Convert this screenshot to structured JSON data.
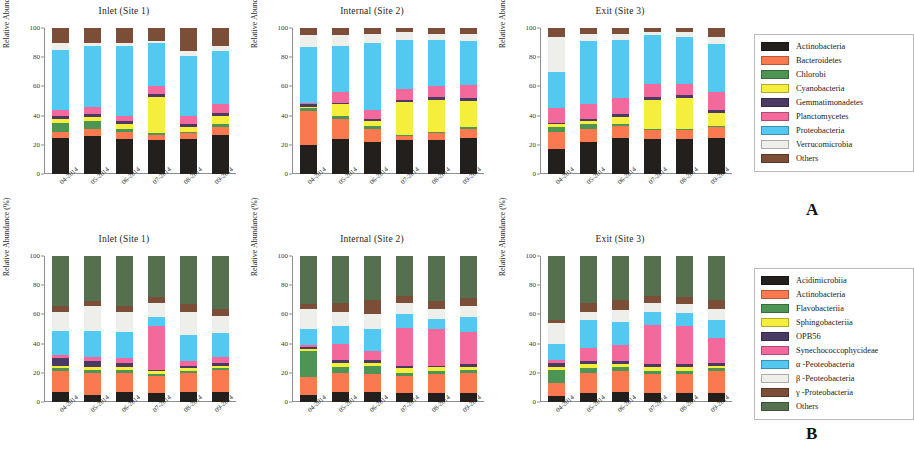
{
  "figure": {
    "panel_letters": [
      "A",
      "B"
    ],
    "y_axis_label": "Relative Abundance (%)",
    "y_ticks": [
      "0",
      "20",
      "40",
      "60",
      "80",
      "100"
    ],
    "x_ticks": [
      "04-2014",
      "05-2014",
      "06-2014",
      "07-2014",
      "08-2014",
      "09-2014"
    ],
    "panel_titles": [
      "Inlet (Site 1)",
      "Internal (Site 2)",
      "Exit (Site 3)"
    ]
  },
  "legend_a": {
    "items": [
      {
        "label": "Actinobacteria",
        "color": "#231f1c"
      },
      {
        "label": "Bacteroidetes",
        "color": "#f97a50"
      },
      {
        "label": "Chlorobi",
        "color": "#4e9455"
      },
      {
        "label": "Cyanobacteria",
        "color": "#f6ee3c"
      },
      {
        "label": "Gemmatimonadetes",
        "color": "#4b3a63"
      },
      {
        "label": "Planctomycetes",
        "color": "#f4699c"
      },
      {
        "label": "Proteobacteria",
        "color": "#53c8f0"
      },
      {
        "label": "Verrucomicrobia",
        "color": "#eeeeea"
      },
      {
        "label": "Others",
        "color": "#7c4e38"
      }
    ]
  },
  "legend_b": {
    "items": [
      {
        "label": "Acidimicrobiia",
        "color": "#231f1c"
      },
      {
        "label": "Actinobacteria",
        "color": "#f97a50"
      },
      {
        "label": "Flavobacteriia",
        "color": "#4e9455"
      },
      {
        "label": "Sphingobacteriia",
        "color": "#f6ee3c"
      },
      {
        "label": "OPB56",
        "color": "#4b3a63"
      },
      {
        "label": "Synechococcophycideae",
        "color": "#f4699c"
      },
      {
        "label": "α -Peoteobacteria",
        "color": "#53c8f0"
      },
      {
        "label": "β -Peoteobacteria",
        "color": "#eeeeea"
      },
      {
        "label": "γ -Proteobacteria",
        "color": "#7c4e38"
      },
      {
        "label": "Others",
        "color": "#55704e"
      }
    ]
  },
  "chart_data": [
    {
      "type": "bar",
      "stacked": true,
      "panel": "A",
      "title": "Inlet (Site 1)",
      "xlabel": "",
      "ylabel": "Relative Abundance (%)",
      "ylim": [
        0,
        100
      ],
      "grid": false,
      "legend_position": "right",
      "categories": [
        "04-2014",
        "05-2014",
        "06-2014",
        "07-2014",
        "08-2014",
        "09-2014"
      ],
      "series": [
        {
          "name": "Actinobacteria",
          "color": "#231f1c",
          "values": [
            25,
            26,
            24,
            23,
            24,
            27
          ]
        },
        {
          "name": "Bacteroidetes",
          "color": "#f97a50",
          "values": [
            4,
            5,
            5,
            4,
            4,
            5
          ]
        },
        {
          "name": "Chlorobi",
          "color": "#4e9455",
          "values": [
            6,
            5,
            2,
            1,
            1,
            2
          ]
        },
        {
          "name": "Cyanobacteria",
          "color": "#f6ee3c",
          "values": [
            3,
            3,
            3,
            25,
            3,
            6
          ]
        },
        {
          "name": "Gemmatimonadetes",
          "color": "#4b3a63",
          "values": [
            2,
            2,
            2,
            2,
            2,
            2
          ]
        },
        {
          "name": "Planctomycetes",
          "color": "#f4699c",
          "values": [
            4,
            5,
            4,
            5,
            6,
            6
          ]
        },
        {
          "name": "Proteobacteria",
          "color": "#53c8f0",
          "values": [
            41,
            42,
            48,
            30,
            41,
            36
          ]
        },
        {
          "name": "Verrucomicrobia",
          "color": "#eeeeea",
          "values": [
            5,
            2,
            2,
            1,
            3,
            4
          ]
        },
        {
          "name": "Others",
          "color": "#7c4e38",
          "values": [
            10,
            10,
            10,
            9,
            16,
            12
          ]
        }
      ]
    },
    {
      "type": "bar",
      "stacked": true,
      "panel": "A",
      "title": "Internal (Site 2)",
      "xlabel": "",
      "ylabel": "Relative Abundance (%)",
      "ylim": [
        0,
        100
      ],
      "grid": false,
      "legend_position": "right",
      "categories": [
        "04-2014",
        "05-2014",
        "06-2014",
        "07-2014",
        "08-2014",
        "09-2014"
      ],
      "series": [
        {
          "name": "Actinobacteria",
          "color": "#231f1c",
          "values": [
            20,
            24,
            22,
            23,
            23,
            25
          ]
        },
        {
          "name": "Bacteroidetes",
          "color": "#f97a50",
          "values": [
            23,
            14,
            9,
            3,
            5,
            6
          ]
        },
        {
          "name": "Chlorobi",
          "color": "#4e9455",
          "values": [
            2,
            2,
            2,
            1,
            1,
            1
          ]
        },
        {
          "name": "Cyanobacteria",
          "color": "#f6ee3c",
          "values": [
            1,
            8,
            3,
            22,
            22,
            18
          ]
        },
        {
          "name": "Gemmatimonadetes",
          "color": "#4b3a63",
          "values": [
            2,
            1,
            2,
            2,
            2,
            2
          ]
        },
        {
          "name": "Planctomycetes",
          "color": "#f4699c",
          "values": [
            1,
            7,
            6,
            7,
            7,
            9
          ]
        },
        {
          "name": "Proteobacteria",
          "color": "#53c8f0",
          "values": [
            38,
            32,
            46,
            34,
            32,
            30
          ]
        },
        {
          "name": "Verrucomicrobia",
          "color": "#eeeeea",
          "values": [
            8,
            7,
            6,
            5,
            4,
            5
          ]
        },
        {
          "name": "Others",
          "color": "#7c4e38",
          "values": [
            5,
            5,
            4,
            3,
            4,
            4
          ]
        }
      ]
    },
    {
      "type": "bar",
      "stacked": true,
      "panel": "A",
      "title": "Exit (Site 3)",
      "xlabel": "",
      "ylabel": "Relative Abundance (%)",
      "ylim": [
        0,
        100
      ],
      "grid": false,
      "legend_position": "right",
      "categories": [
        "04-2014",
        "05-2014",
        "06-2014",
        "07-2014",
        "08-2014",
        "09-2014"
      ],
      "series": [
        {
          "name": "Actinobacteria",
          "color": "#231f1c",
          "values": [
            17,
            22,
            25,
            24,
            24,
            25
          ]
        },
        {
          "name": "Bacteroidetes",
          "color": "#f97a50",
          "values": [
            12,
            9,
            8,
            6,
            6,
            7
          ]
        },
        {
          "name": "Chlorobi",
          "color": "#4e9455",
          "values": [
            3,
            3,
            1,
            1,
            1,
            1
          ]
        },
        {
          "name": "Cyanobacteria",
          "color": "#f6ee3c",
          "values": [
            2,
            2,
            5,
            20,
            21,
            9
          ]
        },
        {
          "name": "Gemmatimonadetes",
          "color": "#4b3a63",
          "values": [
            1,
            2,
            2,
            2,
            2,
            2
          ]
        },
        {
          "name": "Planctomycetes",
          "color": "#f4699c",
          "values": [
            10,
            10,
            11,
            9,
            8,
            12
          ]
        },
        {
          "name": "Proteobacteria",
          "color": "#53c8f0",
          "values": [
            25,
            43,
            40,
            33,
            32,
            33
          ]
        },
        {
          "name": "Verrucomicrobia",
          "color": "#eeeeea",
          "values": [
            24,
            5,
            4,
            2,
            3,
            5
          ]
        },
        {
          "name": "Others",
          "color": "#7c4e38",
          "values": [
            6,
            4,
            4,
            3,
            3,
            6
          ]
        }
      ]
    },
    {
      "type": "bar",
      "stacked": true,
      "panel": "B",
      "title": "Inlet (Site 1)",
      "xlabel": "",
      "ylabel": "Relative Abundance (%)",
      "ylim": [
        0,
        100
      ],
      "grid": false,
      "legend_position": "right",
      "categories": [
        "04-2014",
        "05-2014",
        "06-2014",
        "07-2014",
        "08-2014",
        "09-2014"
      ],
      "series": [
        {
          "name": "Acidimicrobiia",
          "color": "#231f1c",
          "values": [
            7,
            5,
            7,
            6,
            7,
            7
          ]
        },
        {
          "name": "Actinobacteria",
          "color": "#f97a50",
          "values": [
            14,
            15,
            13,
            12,
            13,
            15
          ]
        },
        {
          "name": "Flavobacteriia",
          "color": "#4e9455",
          "values": [
            2,
            2,
            2,
            1,
            1,
            1
          ]
        },
        {
          "name": "Sphingobacteriia",
          "color": "#f6ee3c",
          "values": [
            2,
            2,
            2,
            2,
            2,
            2
          ]
        },
        {
          "name": "OPB56",
          "color": "#4b3a63",
          "values": [
            5,
            4,
            3,
            1,
            2,
            2
          ]
        },
        {
          "name": "Synechococcophycideae",
          "color": "#f4699c",
          "values": [
            2,
            3,
            3,
            30,
            3,
            4
          ]
        },
        {
          "name": "α -Peoteobacteria",
          "color": "#53c8f0",
          "values": [
            17,
            18,
            18,
            6,
            18,
            16
          ]
        },
        {
          "name": "β -Peoteobacteria",
          "color": "#eeeeea",
          "values": [
            13,
            17,
            14,
            10,
            16,
            12
          ]
        },
        {
          "name": "γ -Proteobacteria",
          "color": "#7c4e38",
          "values": [
            4,
            3,
            4,
            4,
            5,
            5
          ]
        },
        {
          "name": "Others",
          "color": "#55704e",
          "values": [
            34,
            31,
            34,
            28,
            33,
            36
          ]
        }
      ]
    },
    {
      "type": "bar",
      "stacked": true,
      "panel": "B",
      "title": "Internal (Site 2)",
      "xlabel": "",
      "ylabel": "Relative Abundance (%)",
      "ylim": [
        0,
        100
      ],
      "grid": false,
      "legend_position": "right",
      "categories": [
        "04-2014",
        "05-2014",
        "06-2014",
        "07-2014",
        "08-2014",
        "09-2014"
      ],
      "series": [
        {
          "name": "Acidimicrobiia",
          "color": "#231f1c",
          "values": [
            5,
            7,
            7,
            6,
            6,
            6
          ]
        },
        {
          "name": "Actinobacteria",
          "color": "#f97a50",
          "values": [
            12,
            13,
            12,
            12,
            13,
            14
          ]
        },
        {
          "name": "Flavobacteriia",
          "color": "#4e9455",
          "values": [
            18,
            4,
            6,
            2,
            2,
            2
          ]
        },
        {
          "name": "Sphingobacteriia",
          "color": "#f6ee3c",
          "values": [
            1,
            3,
            2,
            3,
            3,
            2
          ]
        },
        {
          "name": "OPB56",
          "color": "#4b3a63",
          "values": [
            2,
            2,
            2,
            2,
            1,
            2
          ]
        },
        {
          "name": "Synechococcophycideae",
          "color": "#f4699c",
          "values": [
            1,
            11,
            6,
            26,
            25,
            22
          ]
        },
        {
          "name": "α -Peoteobacteria",
          "color": "#53c8f0",
          "values": [
            11,
            12,
            15,
            9,
            7,
            10
          ]
        },
        {
          "name": "β -Peoteobacteria",
          "color": "#eeeeea",
          "values": [
            14,
            10,
            10,
            8,
            7,
            8
          ]
        },
        {
          "name": "γ -Proteobacteria",
          "color": "#7c4e38",
          "values": [
            3,
            6,
            10,
            5,
            5,
            5
          ]
        },
        {
          "name": "Others",
          "color": "#55704e",
          "values": [
            33,
            32,
            30,
            27,
            31,
            29
          ]
        }
      ]
    },
    {
      "type": "bar",
      "stacked": true,
      "panel": "B",
      "title": "Exit (Site 3)",
      "xlabel": "",
      "ylabel": "Relative Abundance (%)",
      "ylim": [
        0,
        100
      ],
      "grid": false,
      "legend_position": "right",
      "categories": [
        "04-2014",
        "05-2014",
        "06-2014",
        "07-2014",
        "08-2014",
        "09-2014"
      ],
      "series": [
        {
          "name": "Acidimicrobiia",
          "color": "#231f1c",
          "values": [
            4,
            6,
            7,
            6,
            6,
            6
          ]
        },
        {
          "name": "Actinobacteria",
          "color": "#f97a50",
          "values": [
            9,
            14,
            14,
            13,
            13,
            15
          ]
        },
        {
          "name": "Flavobacteriia",
          "color": "#4e9455",
          "values": [
            9,
            3,
            3,
            2,
            2,
            2
          ]
        },
        {
          "name": "Sphingobacteriia",
          "color": "#f6ee3c",
          "values": [
            2,
            3,
            2,
            3,
            3,
            2
          ]
        },
        {
          "name": "OPB56",
          "color": "#4b3a63",
          "values": [
            3,
            2,
            2,
            2,
            2,
            2
          ]
        },
        {
          "name": "Synechococcophycideae",
          "color": "#f4699c",
          "values": [
            2,
            9,
            11,
            27,
            26,
            17
          ]
        },
        {
          "name": "α -Peoteobacteria",
          "color": "#53c8f0",
          "values": [
            11,
            19,
            16,
            9,
            9,
            12
          ]
        },
        {
          "name": "β -Peoteobacteria",
          "color": "#eeeeea",
          "values": [
            14,
            6,
            8,
            6,
            6,
            8
          ]
        },
        {
          "name": "γ -Proteobacteria",
          "color": "#7c4e38",
          "values": [
            2,
            6,
            7,
            5,
            5,
            6
          ]
        },
        {
          "name": "Others",
          "color": "#55704e",
          "values": [
            44,
            32,
            30,
            27,
            28,
            30
          ]
        }
      ]
    }
  ]
}
